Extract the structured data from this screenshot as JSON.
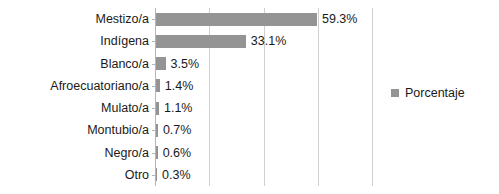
{
  "chart_data": {
    "type": "bar",
    "orientation": "horizontal",
    "title": "",
    "xlabel": "",
    "ylabel": "",
    "categories": [
      "Mestizo/a",
      "Indígena",
      "Blanco/a",
      "Afroecuatoriano/a",
      "Mulato/a",
      "Montubio/a",
      "Negro/a",
      "Otro"
    ],
    "values": [
      59.3,
      33.1,
      3.5,
      1.4,
      1.1,
      0.7,
      0.6,
      0.3
    ],
    "data_labels": [
      "59.3%",
      "33.1%",
      "3.5%",
      "1.4%",
      "1.1%",
      "0.7%",
      "0.6%",
      "0.3%"
    ],
    "series": [
      {
        "name": "Porcentaje",
        "values": [
          59.3,
          33.1,
          3.5,
          1.4,
          1.1,
          0.7,
          0.6,
          0.3
        ],
        "color": "#949494"
      }
    ],
    "xlim": [
      0,
      80
    ],
    "xticks": [
      0,
      20,
      40,
      60,
      80
    ],
    "xtick_labels": [],
    "grid": true,
    "grid_color": "#d0d0d0",
    "axis_color": "#b5b5b5",
    "legend": {
      "position": "right",
      "entries": [
        {
          "label": "Porcentaje",
          "color": "#949494"
        }
      ]
    }
  },
  "legend": {
    "label": "Porcentaje"
  }
}
